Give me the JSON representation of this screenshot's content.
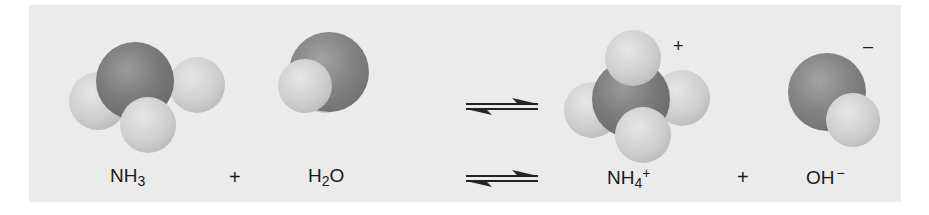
{
  "equation": {
    "reactants": [
      {
        "id": "ammonia",
        "base": "NH",
        "sub": "3",
        "sup": ""
      },
      {
        "id": "water",
        "base": "H",
        "sub": "2",
        "tail": "O"
      }
    ],
    "products": [
      {
        "id": "ammonium",
        "base": "NH",
        "sub": "4",
        "sup": "+"
      },
      {
        "id": "hydroxide",
        "base": "OH",
        "sup": "−"
      }
    ],
    "plus": "+",
    "ion_charges": {
      "ammonium": "+",
      "hydroxide": "–"
    }
  },
  "colors": {
    "panel": "#ebebeb",
    "central_atom": "#7a7a7a",
    "hydrogen": "#cdcdcd",
    "text": "#1a1a1a"
  }
}
